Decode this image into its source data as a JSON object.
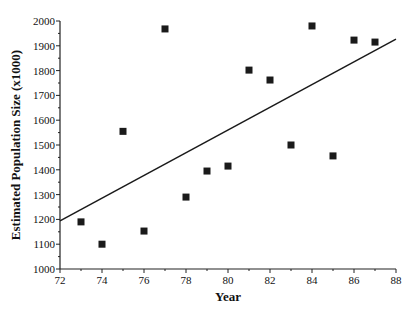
{
  "chart_data": {
    "type": "scatter",
    "title": "",
    "xlabel": "Year",
    "ylabel": "Estimated Population Size (x1000)",
    "xlim": [
      72,
      88
    ],
    "ylim": [
      1000,
      2000
    ],
    "x_ticks": [
      72,
      74,
      76,
      78,
      80,
      82,
      84,
      86,
      88
    ],
    "y_ticks": [
      1000,
      1100,
      1200,
      1300,
      1400,
      1500,
      1600,
      1700,
      1800,
      1900,
      2000
    ],
    "grid": false,
    "legend": null,
    "series": [
      {
        "name": "Population estimates",
        "marker": "square",
        "color": "#1a1a1a",
        "x": [
          73,
          74,
          75,
          76,
          77,
          78,
          79,
          80,
          81,
          82,
          83,
          84,
          85,
          86,
          87
        ],
        "y": [
          1190,
          1100,
          1555,
          1153,
          1968,
          1290,
          1395,
          1415,
          1802,
          1762,
          1500,
          1980,
          1456,
          1923,
          1915
        ]
      }
    ],
    "trendline": {
      "type": "linear",
      "color": "#1a1a1a",
      "x": [
        72,
        88
      ],
      "y": [
        1194,
        1927
      ]
    }
  }
}
